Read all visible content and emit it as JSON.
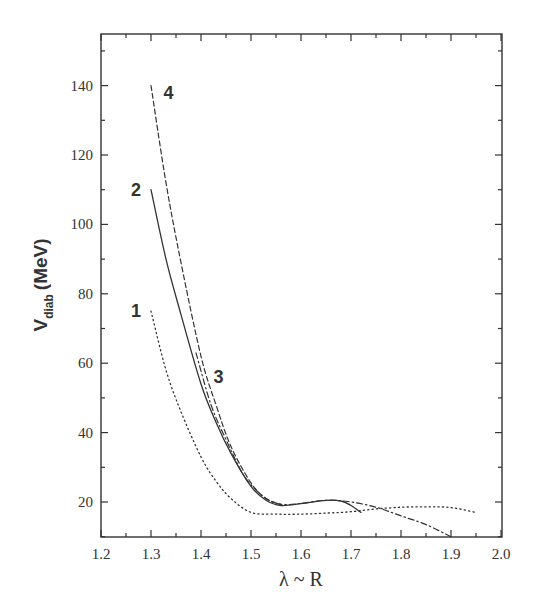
{
  "chart_data": {
    "type": "line",
    "title": "",
    "xlabel": "λ ~ R",
    "ylabel": "V_diab (MeV)",
    "ylabel_main": "V",
    "ylabel_sub": "diab",
    "ylabel_unit": "(MeV)",
    "xlim": [
      1.2,
      2.0
    ],
    "ylim": [
      10,
      155
    ],
    "x_ticks": [
      "1.2",
      "1.3",
      "1.4",
      "1.5",
      "1.6",
      "1.7",
      "1.8",
      "1.9",
      "2.0"
    ],
    "y_ticks": [
      "20",
      "40",
      "60",
      "80",
      "100",
      "120",
      "140"
    ],
    "grid": false,
    "legend": "inline curve numbers",
    "series": [
      {
        "name": "1",
        "style": "dotted",
        "x": [
          1.3,
          1.33,
          1.36,
          1.4,
          1.43,
          1.46,
          1.5,
          1.55,
          1.6,
          1.65,
          1.7,
          1.75,
          1.8,
          1.85,
          1.9,
          1.95
        ],
        "y": [
          75,
          58,
          46,
          33,
          26,
          21,
          17,
          16.5,
          16.5,
          16.8,
          17.2,
          18,
          18.5,
          18.6,
          18.4,
          17
        ]
      },
      {
        "name": "2",
        "style": "solid",
        "x": [
          1.3,
          1.33,
          1.36,
          1.4,
          1.43,
          1.46,
          1.5,
          1.53,
          1.56,
          1.6,
          1.65,
          1.68,
          1.7,
          1.72
        ],
        "y": [
          110,
          90,
          74,
          54,
          43,
          34,
          24.5,
          20.5,
          19,
          19.5,
          20.5,
          20.3,
          19,
          17
        ]
      },
      {
        "name": "3",
        "style": "dash-dot",
        "x": [
          1.39,
          1.42,
          1.45,
          1.48,
          1.5,
          1.53,
          1.56,
          1.6,
          1.65,
          1.7,
          1.75,
          1.8,
          1.85,
          1.9
        ],
        "y": [
          63,
          48,
          38,
          29,
          25,
          21,
          19.3,
          19.6,
          20.5,
          20,
          18.5,
          16,
          13.5,
          10
        ]
      },
      {
        "name": "4",
        "style": "dashed",
        "x": [
          1.3,
          1.33,
          1.36,
          1.4,
          1.43,
          1.46,
          1.5,
          1.53,
          1.56
        ],
        "y": [
          140,
          112,
          89,
          62,
          48,
          36,
          25.5,
          21,
          19.3
        ]
      }
    ],
    "annotations": [
      {
        "text": "1",
        "x": 1.27,
        "y": 75
      },
      {
        "text": "2",
        "x": 1.27,
        "y": 110
      },
      {
        "text": "3",
        "x": 1.435,
        "y": 56
      },
      {
        "text": "4",
        "x": 1.335,
        "y": 138
      }
    ]
  },
  "labels": {
    "x_axis_title": "λ ~ R",
    "y_axis_main": "V",
    "y_axis_sub": "diab",
    "y_axis_unit": "(MeV)"
  }
}
